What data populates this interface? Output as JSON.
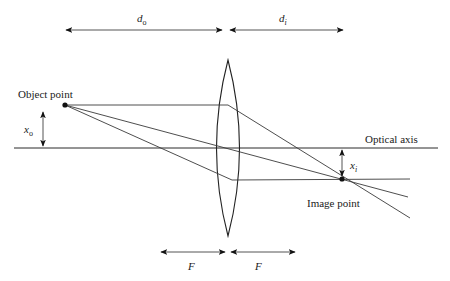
{
  "diagram": {
    "type": "thin-lens ray diagram",
    "labels": {
      "object_point": "Object point",
      "image_point": "Image point",
      "optical_axis": "Optical axis",
      "object_distance": "d",
      "object_distance_sub": "o",
      "image_distance": "d",
      "image_distance_sub": "i",
      "object_height": "x",
      "object_height_sub": "o",
      "image_height": "x",
      "image_height_sub": "i",
      "focal_left": "F",
      "focal_right": "F"
    },
    "colors": {
      "line": "#3a3a3a",
      "background": "#ffffff"
    }
  }
}
